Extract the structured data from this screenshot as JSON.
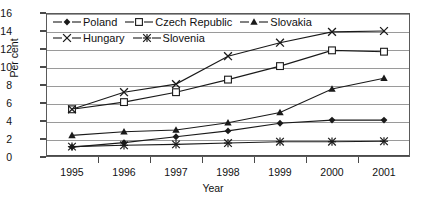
{
  "chart_data": {
    "type": "line",
    "title": "",
    "xlabel": "Year",
    "ylabel": "Per cent",
    "categories": [
      "1995",
      "1996",
      "1997",
      "1998",
      "1999",
      "2000",
      "2001"
    ],
    "x": [
      1995,
      1996,
      1997,
      1998,
      1999,
      2000,
      2001
    ],
    "ylim": [
      0,
      16
    ],
    "yticks": [
      0,
      2,
      4,
      6,
      8,
      10,
      12,
      14,
      16
    ],
    "ytick_labels": [
      "0",
      "2",
      "4",
      "6",
      "8",
      "10",
      "12",
      "14",
      "16"
    ],
    "grid": "horizontal",
    "legend_position": "top-inside",
    "series": [
      {
        "name": "Poland",
        "marker": "filled-diamond",
        "color": "#1a1a1a",
        "values": [
          1.1,
          1.6,
          2.25,
          2.9,
          3.75,
          4.1,
          4.1
        ]
      },
      {
        "name": "Czech Republic",
        "marker": "open-square",
        "color": "#1a1a1a",
        "values": [
          5.3,
          6.1,
          7.2,
          8.6,
          10.1,
          11.85,
          11.7
        ]
      },
      {
        "name": "Slovakia",
        "marker": "filled-triangle",
        "color": "#1a1a1a",
        "values": [
          2.4,
          2.8,
          3.0,
          3.8,
          4.95,
          7.55,
          8.75
        ]
      },
      {
        "name": "Hungary",
        "marker": "cross-x",
        "color": "#1a1a1a",
        "values": [
          5.3,
          7.2,
          8.1,
          11.2,
          12.7,
          13.9,
          14.0
        ]
      },
      {
        "name": "Slovenia",
        "marker": "asterisk",
        "color": "#1a1a1a",
        "values": [
          1.15,
          1.3,
          1.4,
          1.55,
          1.7,
          1.7,
          1.75
        ]
      }
    ]
  },
  "legend": {
    "rows": [
      [
        "Poland",
        "Czech Republic",
        "Slovakia"
      ],
      [
        "Hungary",
        "Slovenia"
      ]
    ]
  },
  "icons": {
    "poland_marker": "filled-diamond-icon",
    "czech_marker": "open-square-icon",
    "slovakia_marker": "filled-triangle-icon",
    "hungary_marker": "cross-x-icon",
    "slovenia_marker": "asterisk-icon"
  }
}
